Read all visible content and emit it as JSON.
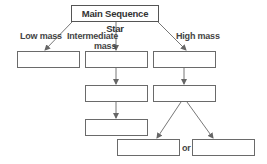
{
  "diagram": {
    "root": "Main Sequence Star",
    "branches": [
      {
        "label": "Low mass"
      },
      {
        "label_line1": "Intermediate",
        "label_line2": "mass"
      },
      {
        "label": "High mass"
      }
    ],
    "connector_text": "or",
    "empty_boxes": 9
  }
}
